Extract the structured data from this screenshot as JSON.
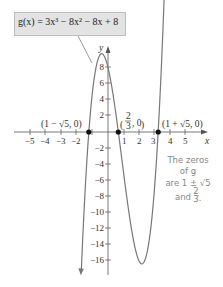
{
  "chart_data": {
    "type": "line",
    "equation_label": "g(x) = 3x³ − 8x² − 8x + 8",
    "xlabel": "x",
    "ylabel": "y",
    "x_ticks": [
      "−5",
      "−4",
      "−3",
      "−2",
      "1",
      "2",
      "3",
      "4",
      "5"
    ],
    "y_ticks": [
      "8",
      "6",
      "4",
      "2",
      "−2",
      "−4",
      "−6",
      "−8",
      "−10",
      "−12",
      "−14",
      "−16"
    ],
    "xlim": [
      -6,
      6
    ],
    "ylim": [
      -18,
      10
    ],
    "grid": false,
    "series": [
      {
        "name": "g(x)",
        "function": "3x^3 - 8x^2 - 8x + 8",
        "color": "#777777"
      }
    ],
    "points": [
      {
        "label": "(1 − √5, 0)",
        "x": -1.236,
        "y": 0
      },
      {
        "label": "(2/3, 0)",
        "x": 0.667,
        "y": 0
      },
      {
        "label": "(1 + √5, 0)",
        "x": 3.236,
        "y": 0
      }
    ],
    "annotation": [
      "The zeros",
      "of g",
      "are 1 ± √5",
      "and 2/3."
    ]
  }
}
